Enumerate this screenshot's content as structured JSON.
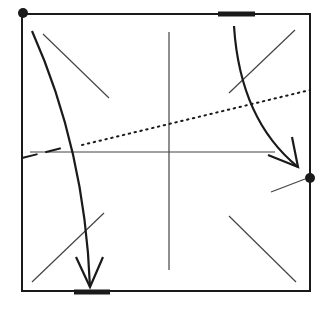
{
  "diagram": {
    "colors": {
      "ink": "#1a1a1a",
      "thin": "#444444",
      "background": "#ffffff"
    },
    "paper_square": {
      "x1": 22,
      "y1": 14,
      "x2": 310,
      "y2": 291
    },
    "dots": [
      {
        "name": "top-left-corner-dot",
        "cx": 23,
        "cy": 13,
        "r": 5
      },
      {
        "name": "right-edge-dot",
        "cx": 310,
        "cy": 178,
        "r": 5
      }
    ],
    "bold_marks": [
      {
        "name": "top-edge-mark",
        "x1": 218,
        "y1": 14,
        "x2": 255,
        "y2": 14
      },
      {
        "name": "bottom-edge-mark",
        "x1": 74,
        "y1": 292,
        "x2": 110,
        "y2": 292
      }
    ],
    "crease_lines": [
      {
        "name": "vertical-center-crease",
        "x1": 169,
        "y1": 32,
        "x2": 169,
        "y2": 270
      },
      {
        "name": "horizontal-center-crease",
        "x1": 30,
        "y1": 152,
        "x2": 275,
        "y2": 152
      },
      {
        "name": "diagonal-top-left",
        "x1": 43,
        "y1": 34,
        "x2": 109,
        "y2": 98
      },
      {
        "name": "diagonal-top-right",
        "x1": 229,
        "y1": 93,
        "x2": 295,
        "y2": 30
      },
      {
        "name": "diagonal-bottom-left",
        "x1": 32,
        "y1": 282,
        "x2": 104,
        "y2": 213
      },
      {
        "name": "diagonal-bottom-right",
        "x1": 229,
        "y1": 216,
        "x2": 296,
        "y2": 282
      },
      {
        "name": "right-dot-short-line",
        "x1": 271,
        "y1": 192,
        "x2": 305,
        "y2": 179
      }
    ],
    "valley_fold_line": {
      "name": "dotted-fold-line",
      "x1": 82,
      "y1": 145,
      "x2": 310,
      "y2": 90
    },
    "dashed_segment": {
      "name": "dashed-fold-segment",
      "x1": 22,
      "y1": 158,
      "x2": 66,
      "y2": 147
    },
    "arrows": [
      {
        "name": "left-fold-arrow",
        "path": "M 32 31 Q 85 150 90 287",
        "head": "M 76 257 L 90 287 L 103 257"
      },
      {
        "name": "right-fold-arrow",
        "path": "M 234 26 Q 240 120 298 167",
        "head": "M 268 155 L 298 167 L 292 137"
      }
    ]
  }
}
